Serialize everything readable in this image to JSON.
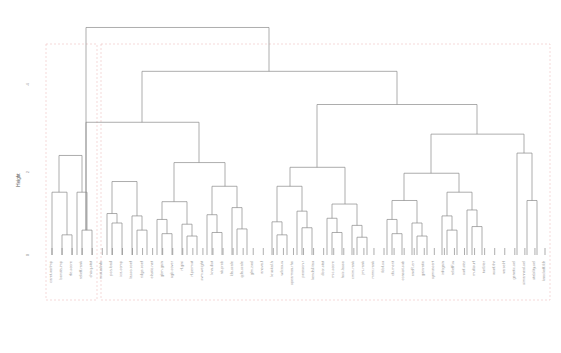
{
  "chart_data": {
    "type": "dendrogram",
    "title": "",
    "subtitle": "",
    "xlabel": "",
    "ylabel": "Height",
    "ylim": [
      0,
      1.0
    ],
    "yticks": [
      {
        "value": 0.0,
        "label": "0"
      },
      {
        "value": 0.35,
        "label": "2"
      },
      {
        "value": 0.72,
        "label": "4"
      }
    ],
    "grid": false,
    "legend": "none",
    "orientation": "vertical",
    "leaf_label_rotation": 90,
    "line_color": "#8a8a8a",
    "cluster_box_color": "#f0c8c8",
    "n_leaves": 50,
    "categories": [
      "caret.varImp",
      "boruta.imp",
      "rfe.score",
      "relieff.rank",
      "chisq.stat",
      "mutualinfo",
      "pca.load",
      "ica.comp",
      "lasso.coef",
      "ridge.coef",
      "elastic.net",
      "gbm.gain",
      "xgb.cover",
      "rf.gini",
      "rf.permut",
      "svm.weight",
      "knn.dist",
      "nb.prob",
      "lda.scale",
      "qda.scale",
      "glm.zval",
      "anova.f",
      "kruskal.h",
      "wilcox.w",
      "spearman.rho",
      "pearson.r",
      "kendall.tau",
      "dcor.stat",
      "mic.score",
      "hsic.lasso",
      "cmim.rank",
      "jmi.rank",
      "mrmr.rank",
      "fcbf.su",
      "cfs.merit",
      "consist.sub",
      "oneR.err",
      "gainratio",
      "symuncert",
      "infogain",
      "reliefF.w",
      "surf.star",
      "multisurf",
      "turf.iter",
      "vsurf.thr",
      "varselrf",
      "genetic.sel",
      "simanneal.sel",
      "stability.sel",
      "knockoff.fdr"
    ],
    "leaf_heights": [
      0.0,
      0.0,
      0.0,
      0.0,
      0.0,
      0.0,
      0.0,
      0.0,
      0.0,
      0.0,
      0.0,
      0.0,
      0.0,
      0.0,
      0.0,
      0.0,
      0.0,
      0.0,
      0.0,
      0.0,
      0.0,
      0.0,
      0.0,
      0.0,
      0.0,
      0.0,
      0.0,
      0.0,
      0.0,
      0.0,
      0.0,
      0.0,
      0.0,
      0.0,
      0.0,
      0.0,
      0.0,
      0.0,
      0.0,
      0.0,
      0.0,
      0.0,
      0.0,
      0.0,
      0.0,
      0.0,
      0.0,
      0.0,
      0.0,
      0.0
    ],
    "merges": [
      {
        "id": "m1",
        "left_x": 62,
        "right_x": 72,
        "height": 0.085,
        "label": "caret.varImp + boruta.imp"
      },
      {
        "id": "m2",
        "left_x": 52,
        "right_x": 67,
        "height": 0.265,
        "label": "rfe.score + (caret/boruta)"
      },
      {
        "id": "m3",
        "left_x": 82,
        "right_x": 92,
        "height": 0.105,
        "label": "chisq.stat + mutualinfo"
      },
      {
        "id": "m4",
        "left_x": 77,
        "right_x": 87,
        "height": 0.265,
        "label": "relieff.rank + (chisq/mutualinfo)"
      },
      {
        "id": "m5",
        "left_x": 59,
        "right_x": 82,
        "height": 0.42,
        "label": "left block A"
      },
      {
        "id": "m6",
        "left_x": 112,
        "right_x": 122,
        "height": 0.135,
        "label": "ica.comp + lasso.coef"
      },
      {
        "id": "m7",
        "left_x": 107,
        "right_x": 117,
        "height": 0.175,
        "label": "pca.load + cluster"
      },
      {
        "id": "m8",
        "left_x": 137,
        "right_x": 147,
        "height": 0.105,
        "label": "gbm.gain + xgb.cover"
      },
      {
        "id": "m9",
        "left_x": 132,
        "right_x": 142,
        "height": 0.165,
        "label": "elastic.net + cluster"
      },
      {
        "id": "m10",
        "left_x": 112,
        "right_x": 137,
        "height": 0.31,
        "label": "mid-left block"
      },
      {
        "id": "m11",
        "left_x": 162,
        "right_x": 172,
        "height": 0.09,
        "label": "rf.permut + svm.weight"
      },
      {
        "id": "m12",
        "left_x": 157,
        "right_x": 167,
        "height": 0.15,
        "label": "rf.gini + cluster"
      },
      {
        "id": "m13",
        "left_x": 187,
        "right_x": 197,
        "height": 0.08,
        "label": "nb.prob + lda.scale"
      },
      {
        "id": "m14",
        "left_x": 182,
        "right_x": 192,
        "height": 0.13,
        "label": "knn.dist + cluster"
      },
      {
        "id": "m15",
        "left_x": 162,
        "right_x": 187,
        "height": 0.225,
        "label": "model-weight block"
      },
      {
        "id": "m16",
        "left_x": 212,
        "right_x": 222,
        "height": 0.095,
        "label": "glm.zval + anova.f"
      },
      {
        "id": "m17",
        "left_x": 207,
        "right_x": 217,
        "height": 0.17,
        "label": "qda.scale + cluster"
      },
      {
        "id": "m18",
        "left_x": 237,
        "right_x": 247,
        "height": 0.11,
        "label": "wilcox.w + spearman.rho"
      },
      {
        "id": "m19",
        "left_x": 232,
        "right_x": 242,
        "height": 0.2,
        "label": "kruskal.h + cluster"
      },
      {
        "id": "m20",
        "left_x": 212,
        "right_x": 237,
        "height": 0.29,
        "label": "stat-test block"
      },
      {
        "id": "m21",
        "left_x": 174,
        "right_x": 225,
        "height": 0.39,
        "label": "mid block"
      },
      {
        "id": "m22",
        "left_x": 86,
        "right_x": 199,
        "height": 0.56,
        "label": "left + mid"
      },
      {
        "id": "m23",
        "left_x": 277,
        "right_x": 287,
        "height": 0.085,
        "label": "kendall.tau + dcor.stat"
      },
      {
        "id": "m24",
        "left_x": 272,
        "right_x": 282,
        "height": 0.14,
        "label": "pearson.r + cluster"
      },
      {
        "id": "m25",
        "left_x": 302,
        "right_x": 312,
        "height": 0.115,
        "label": "hsic.lasso + cmim.rank"
      },
      {
        "id": "m26",
        "left_x": 297,
        "right_x": 307,
        "height": 0.185,
        "label": "mic.score + cluster"
      },
      {
        "id": "m27",
        "left_x": 277,
        "right_x": 302,
        "height": 0.29,
        "label": "correlation block"
      },
      {
        "id": "m28",
        "left_x": 332,
        "right_x": 342,
        "height": 0.095,
        "label": "mrmr.rank + fcbf.su"
      },
      {
        "id": "m29",
        "left_x": 327,
        "right_x": 337,
        "height": 0.155,
        "label": "jmi.rank + cluster"
      },
      {
        "id": "m30",
        "left_x": 357,
        "right_x": 367,
        "height": 0.075,
        "label": "consist.sub + oneR.err"
      },
      {
        "id": "m31",
        "left_x": 352,
        "right_x": 362,
        "height": 0.125,
        "label": "cfs.merit + cluster"
      },
      {
        "id": "m32",
        "left_x": 332,
        "right_x": 357,
        "height": 0.215,
        "label": "filter block"
      },
      {
        "id": "m33",
        "left_x": 290,
        "right_x": 345,
        "height": 0.37,
        "label": "info-theory block"
      },
      {
        "id": "m34",
        "left_x": 392,
        "right_x": 402,
        "height": 0.09,
        "label": "gainratio + symuncert"
      },
      {
        "id": "m35",
        "left_x": 387,
        "right_x": 397,
        "height": 0.15,
        "label": "infogain + cluster"
      },
      {
        "id": "m36",
        "left_x": 417,
        "right_x": 427,
        "height": 0.08,
        "label": "reliefF.w + surf.star"
      },
      {
        "id": "m37",
        "left_x": 412,
        "right_x": 422,
        "height": 0.135,
        "label": "multisurf + cluster"
      },
      {
        "id": "m38",
        "left_x": 392,
        "right_x": 417,
        "height": 0.23,
        "label": "relief family"
      },
      {
        "id": "m39",
        "left_x": 447,
        "right_x": 457,
        "height": 0.105,
        "label": "vsurf.thr + varselrf"
      },
      {
        "id": "m40",
        "left_x": 442,
        "right_x": 452,
        "height": 0.165,
        "label": "turf.iter + cluster"
      },
      {
        "id": "m41",
        "left_x": 472,
        "right_x": 482,
        "height": 0.12,
        "label": "genetic.sel + simanneal.sel"
      },
      {
        "id": "m42",
        "left_x": 467,
        "right_x": 477,
        "height": 0.19,
        "label": "stability.sel + cluster"
      },
      {
        "id": "m43",
        "left_x": 447,
        "right_x": 472,
        "height": 0.265,
        "label": "wrapper block"
      },
      {
        "id": "m44",
        "left_x": 404,
        "right_x": 459,
        "height": 0.345,
        "label": "search block"
      },
      {
        "id": "m45",
        "left_x": 527,
        "right_x": 537,
        "height": 0.23,
        "label": "knockoff pair"
      },
      {
        "id": "m46",
        "left_x": 517,
        "right_x": 532,
        "height": 0.43,
        "label": "rightmost cluster"
      },
      {
        "id": "m47",
        "left_x": 431,
        "right_x": 524,
        "height": 0.51,
        "label": "right block"
      },
      {
        "id": "m48",
        "left_x": 317,
        "right_x": 477,
        "height": 0.635,
        "label": "right half"
      },
      {
        "id": "m49",
        "left_x": 142,
        "right_x": 397,
        "height": 0.775,
        "label": "upper join"
      },
      {
        "id": "m50",
        "left_x": 86,
        "right_x": 269,
        "height": 0.96,
        "label": "root"
      }
    ],
    "cluster_boxes": [
      {
        "id": "box-1",
        "x0": 46,
        "x1": 97,
        "y_top": 44,
        "y_bottom": 300,
        "label": "cluster 1"
      },
      {
        "id": "box-2",
        "x0": 101,
        "x1": 550,
        "y_top": 44,
        "y_bottom": 300,
        "label": "cluster 2"
      }
    ]
  },
  "axes": {
    "ylabel": "Height",
    "ytick_labels": [
      "0",
      "2",
      "4"
    ]
  }
}
